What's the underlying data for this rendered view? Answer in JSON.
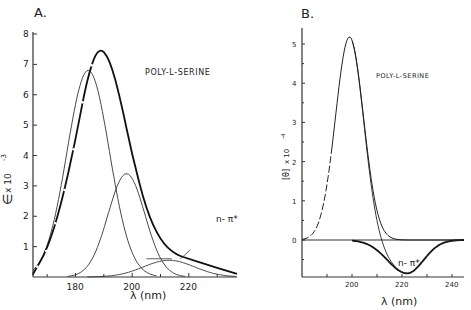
{
  "chart_data": [
    {
      "panel": "A.",
      "type": "line",
      "title": "POLY-L-SERINE",
      "xlabel": "λ (nm)",
      "ylabel": "ε x 10^-3",
      "ylabel_parts": {
        "main": "∈",
        "mid": " x 10",
        "exp": "-3"
      },
      "xlim": [
        165,
        237
      ],
      "ylim": [
        0,
        8
      ],
      "xticks": [
        180,
        200,
        220
      ],
      "xminor": [
        170,
        190,
        210,
        230
      ],
      "yticks": [
        1,
        2,
        3,
        4,
        5,
        6,
        7,
        8
      ],
      "grid": false,
      "annotations": [
        {
          "text": "n-π*",
          "x": 222,
          "y": 1.1
        }
      ],
      "series": [
        {
          "name": "total absorption (dashed < 186 nm)",
          "style": "thick",
          "peak": {
            "x": 188,
            "y": 7.6
          },
          "x": [
            165,
            170,
            175,
            180,
            184,
            188,
            192,
            196,
            200,
            205,
            210,
            215,
            220,
            225,
            230,
            237
          ],
          "y": [
            0.1,
            0.9,
            2.4,
            4.5,
            6.5,
            7.6,
            7.2,
            5.8,
            4.0,
            2.2,
            1.2,
            0.75,
            0.6,
            0.45,
            0.3,
            0.1
          ]
        },
        {
          "name": "band 1",
          "style": "thin",
          "peak": {
            "x": 184.5,
            "y": 6.8
          },
          "center": 184.5,
          "amplitude": 6.8,
          "width": 7.5
        },
        {
          "name": "band 2",
          "style": "thin",
          "peak": {
            "x": 198,
            "y": 3.4
          },
          "center": 198,
          "amplitude": 3.4,
          "width": 6.5
        },
        {
          "name": "n-π* band",
          "style": "thin",
          "peak": {
            "x": 213,
            "y": 0.55
          },
          "center": 213,
          "amplitude": 0.55,
          "width": 9
        }
      ]
    },
    {
      "panel": "B.",
      "type": "line",
      "title": "POLY-L-SERINE",
      "xlabel": "λ (nm)",
      "ylabel": "[θ] x 10^-4",
      "ylabel_parts": {
        "main": "[θ]",
        "mid": " x 10",
        "exp": "-4"
      },
      "xlim": [
        180,
        245
      ],
      "ylim": [
        -0.95,
        5.4
      ],
      "xticks": [
        200,
        220,
        240
      ],
      "xminor": [
        190,
        210,
        230
      ],
      "yticks": [
        0,
        1,
        2,
        3,
        4,
        5
      ],
      "grid": false,
      "annotations": [
        {
          "text": "n-π*",
          "x": 224,
          "y": -0.5
        }
      ],
      "series": [
        {
          "name": "positive CD band (dashed < 192 nm)",
          "style": "thin",
          "peak": {
            "x": 199,
            "y": 5.18
          },
          "center": 199,
          "amplitude": 5.18,
          "width": 5.6
        },
        {
          "name": "n-π* negative band",
          "style": "thick",
          "peak": {
            "x": 222,
            "y": -0.85
          },
          "center": 222,
          "amplitude": -0.85,
          "width": 6
        },
        {
          "name": "sum",
          "style": "thin"
        }
      ]
    }
  ],
  "panels": {
    "a": {
      "label": "A.",
      "title": "POLY-L-SERINE",
      "xlabel": "λ (nm)",
      "ytick_labels": [
        "1",
        "2",
        "3",
        "4",
        "5",
        "6",
        "7",
        "8"
      ],
      "xtick_labels": [
        "180",
        "200",
        "220"
      ],
      "annotation": "n- π*"
    },
    "b": {
      "label": "B.",
      "title": "POLY-L-SERINE",
      "xlabel": "λ (nm)",
      "ytick_labels": [
        "0",
        "1",
        "2",
        "3",
        "4",
        "5"
      ],
      "xtick_labels": [
        "200",
        "220",
        "240"
      ],
      "annotation": "n- π*"
    }
  }
}
